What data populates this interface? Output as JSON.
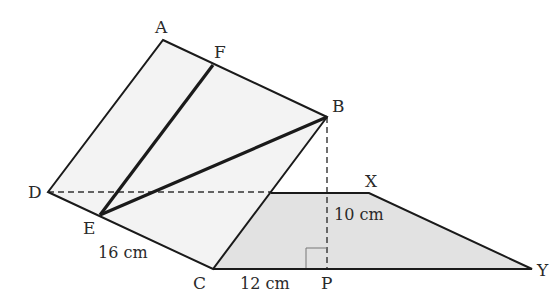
{
  "figure": {
    "colors": {
      "stroke": "#1a1a1a",
      "parallelogram_fill": "#f3f3f3",
      "trapezoid_fill": "#e2e2e2",
      "dashed": "#333333",
      "right_angle": "#777777"
    },
    "points": {
      "A": {
        "label": "A",
        "x": 163,
        "y": 40
      },
      "F": {
        "label": "F",
        "x": 213,
        "y": 65
      },
      "B": {
        "label": "B",
        "x": 327,
        "y": 117
      },
      "D": {
        "label": "D",
        "x": 48,
        "y": 192
      },
      "E": {
        "label": "E",
        "x": 100,
        "y": 215
      },
      "C": {
        "label": "C",
        "x": 213,
        "y": 269
      },
      "P": {
        "label": "P",
        "x": 327,
        "y": 269
      },
      "X": {
        "label": "X",
        "x": 369,
        "y": 193
      },
      "Y": {
        "label": "Y",
        "x": 532,
        "y": 269
      }
    },
    "measurements": {
      "EC": "16 cm",
      "BP": "10 cm",
      "CP": "12 cm"
    }
  }
}
